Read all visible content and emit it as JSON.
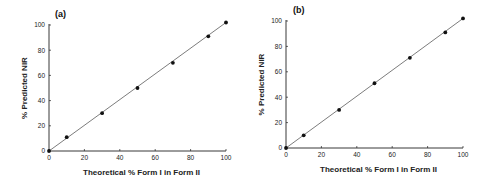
{
  "chart_data": [
    {
      "type": "scatter",
      "panel_label": "(a)",
      "title": "",
      "xlabel": "Theoretical % Form I in Form II",
      "ylabel": "% Predicted NIR",
      "xlim": [
        0,
        100
      ],
      "ylim": [
        0,
        100
      ],
      "xticks": [
        0,
        20,
        40,
        60,
        80,
        100
      ],
      "yticks": [
        0,
        20,
        40,
        60,
        80,
        100
      ],
      "grid": false,
      "series": [
        {
          "name": "measured",
          "x": [
            0,
            10,
            30,
            50,
            70,
            90,
            100
          ],
          "y": [
            0,
            11,
            30,
            50,
            70,
            91,
            102
          ]
        },
        {
          "name": "fit line",
          "type": "line",
          "x": [
            0,
            100
          ],
          "y": [
            0,
            102
          ]
        }
      ]
    },
    {
      "type": "scatter",
      "panel_label": "(b)",
      "title": "",
      "xlabel": "Theoretical % Form I in Form II",
      "ylabel": "% Predicted NIR",
      "xlim": [
        0,
        100
      ],
      "ylim": [
        0,
        100
      ],
      "xticks": [
        0,
        20,
        40,
        60,
        80,
        100
      ],
      "yticks": [
        0,
        20,
        40,
        60,
        80,
        100
      ],
      "grid": false,
      "series": [
        {
          "name": "measured",
          "x": [
            0,
            10,
            30,
            50,
            70,
            90,
            100
          ],
          "y": [
            0,
            10,
            30,
            51,
            71,
            91,
            102
          ]
        },
        {
          "name": "fit line",
          "type": "line",
          "x": [
            0,
            100
          ],
          "y": [
            0,
            102
          ]
        }
      ]
    }
  ],
  "panels": [
    {
      "label": "(a)",
      "xlabel": "Theoretical % Form I in Form II",
      "ylabel": "% Predicted NIR"
    },
    {
      "label": "(b)",
      "xlabel": "Theoretical % Form I in Form II",
      "ylabel": "% Predicted NIR"
    }
  ]
}
